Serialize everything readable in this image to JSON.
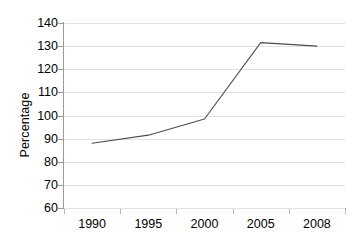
{
  "chart_data": {
    "type": "line",
    "title": "",
    "subtitle": "",
    "xlabel": "",
    "ylabel": "Percentage",
    "categories": [
      "1990",
      "1995",
      "2000",
      "2005",
      "2008"
    ],
    "values": [
      88,
      91.5,
      98.5,
      131.5,
      130
    ],
    "series": [
      {
        "name": "",
        "values": [
          88,
          91.5,
          98.5,
          131.5,
          130
        ]
      }
    ],
    "ylim": [
      60,
      140
    ],
    "ytick_step": 10,
    "yticks": [
      140,
      130,
      120,
      110,
      100,
      90,
      80,
      70,
      60
    ],
    "ytick_labels": [
      "140",
      "130",
      "120",
      "110",
      "100",
      "90",
      "80",
      "70",
      "60"
    ],
    "xtick_labels": [
      "1990",
      "1995",
      "2000",
      "2005",
      "2008"
    ],
    "grid": true,
    "grid_axis": "y",
    "legend": false,
    "legend_position": "none",
    "markers": false,
    "line_color": "#4d4d4d",
    "grid_color": "#e2e2e2",
    "axis_color": "#9a9a9a",
    "background_color": "#ffffff",
    "text_color": "#000000",
    "annotations": []
  }
}
